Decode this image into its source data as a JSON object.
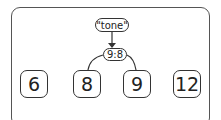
{
  "diagram": {
    "query": "\"tone\"",
    "split_node": "9:8",
    "children": [
      "8",
      "9"
    ],
    "leaves": [
      "6",
      "8",
      "9",
      "12"
    ]
  }
}
